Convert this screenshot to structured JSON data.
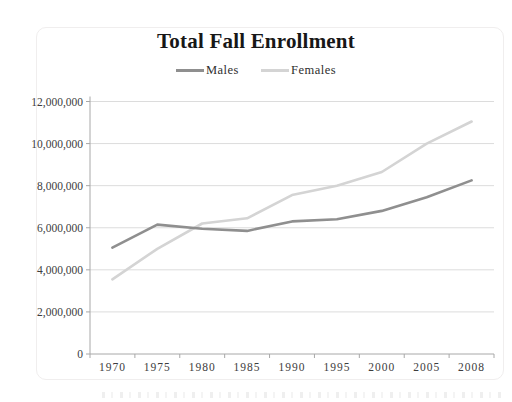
{
  "title": "Total Fall Enrollment",
  "colors": {
    "males_line": "#8f8f8f",
    "females_line": "#d4d4d4",
    "gridline": "#dcdcdc",
    "axis": "#a8a8a8",
    "tick_text": "#3d3d3d",
    "title_text": "#171717"
  },
  "chart_data": {
    "type": "line",
    "title": "Total Fall Enrollment",
    "xlabel": "",
    "ylabel": "",
    "x": [
      "1970",
      "1975",
      "1980",
      "1985",
      "1990",
      "1995",
      "2000",
      "2005",
      "2008"
    ],
    "series": [
      {
        "name": "Males",
        "color_key": "males_line",
        "values": [
          5050000,
          6150000,
          5950000,
          5850000,
          6300000,
          6400000,
          6800000,
          7450000,
          8250000
        ]
      },
      {
        "name": "Females",
        "color_key": "females_line",
        "values": [
          3550000,
          5000000,
          6200000,
          6450000,
          7550000,
          8000000,
          8650000,
          10000000,
          11050000
        ]
      }
    ],
    "ylim": [
      0,
      12000000
    ],
    "y_tick_step": 2000000,
    "y_tick_labels": [
      "0",
      "2,000,000",
      "4,000,000",
      "6,000,000",
      "8,000,000",
      "10,000,000",
      "12,000,000"
    ],
    "grid": true,
    "legend_position": "top-center"
  }
}
